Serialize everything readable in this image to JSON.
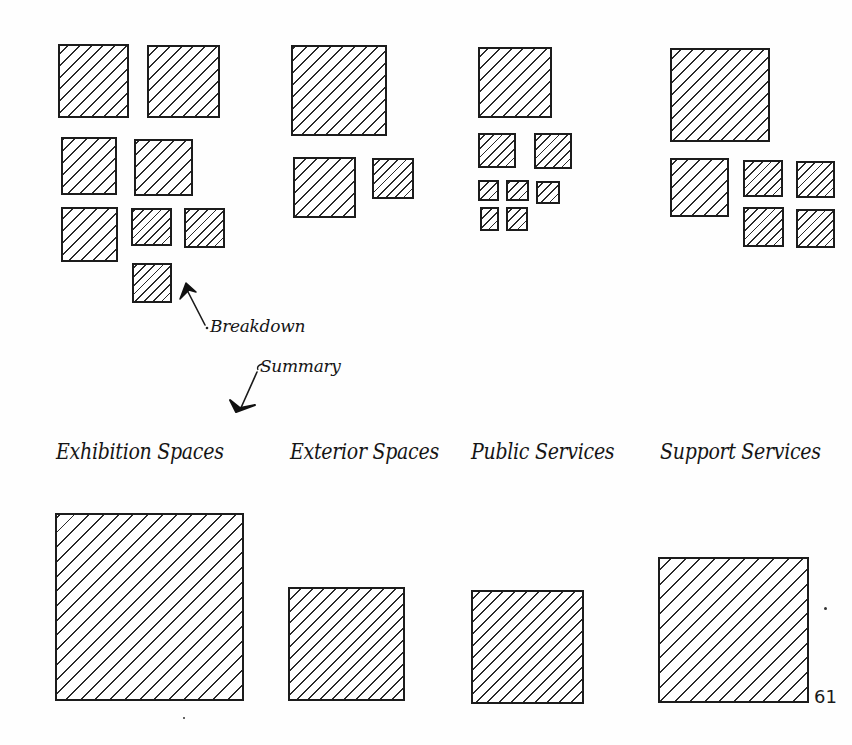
{
  "annotations": {
    "breakdown_label": "Breakdown",
    "summary_label": "Summary"
  },
  "categories": [
    {
      "id": "exhibition",
      "label": "Exhibition Spaces",
      "breakdown_box_count": 8,
      "summary_size": "largest"
    },
    {
      "id": "exterior",
      "label": "Exterior Spaces",
      "breakdown_box_count": 3,
      "summary_size": "small"
    },
    {
      "id": "public",
      "label": "Public Services",
      "breakdown_box_count": 8,
      "summary_size": "small"
    },
    {
      "id": "support",
      "label": "Support Services",
      "breakdown_box_count": 6,
      "summary_size": "medium"
    }
  ],
  "page_number": "61",
  "colors": {
    "ink": "#1c1c1c",
    "paper": "#ffffff"
  }
}
